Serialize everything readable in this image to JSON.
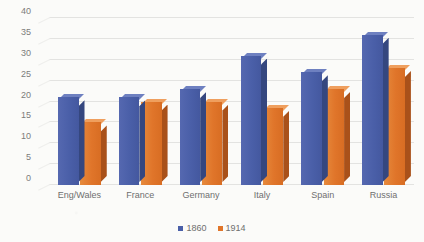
{
  "chart_data": {
    "type": "bar",
    "title": "",
    "subtitle": "",
    "xlabel": "",
    "ylabel": "",
    "categories": [
      "Eng/Wales",
      "France",
      "Germany",
      "Italy",
      "Spain",
      "Russia"
    ],
    "series": [
      {
        "name": "1860",
        "color": "#4a5fa8",
        "values": [
          21,
          21,
          23,
          31,
          27,
          36
        ]
      },
      {
        "name": "1914",
        "color": "#e0752a",
        "values": [
          15,
          20,
          20,
          18.5,
          23,
          28
        ]
      }
    ],
    "ylim": [
      0,
      40
    ],
    "ytick_step": 5,
    "yticks": [
      "0",
      "5",
      "10",
      "15",
      "20",
      "25",
      "30",
      "35",
      "40"
    ],
    "grid": true,
    "grid_axis": "y",
    "legend_position": "bottom",
    "three_d": true
  },
  "legend": {
    "items": [
      {
        "label": "1860",
        "color": "#4a5fa8"
      },
      {
        "label": "1914",
        "color": "#e0752a"
      }
    ]
  },
  "colors": {
    "series_1860": "#4a5fa8",
    "series_1914": "#e0752a",
    "gridline": "#e3e3e1",
    "text": "#6f6f6f",
    "background": "#fbfbf9"
  }
}
